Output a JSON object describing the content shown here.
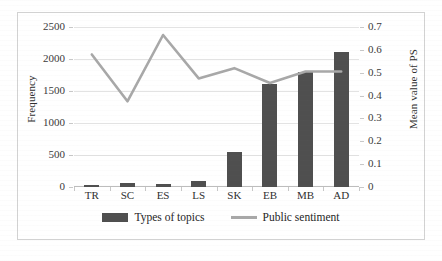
{
  "chart_data": {
    "type": "bar",
    "title": "",
    "categories": [
      "TR",
      "SC",
      "ES",
      "LS",
      "SK",
      "EB",
      "MB",
      "AD"
    ],
    "xlabel": "",
    "ylabel": "Frequency",
    "y2label": "Mean value of PS",
    "ylim": [
      0,
      2500
    ],
    "y2lim": [
      0,
      0.7
    ],
    "yticks": [
      "0",
      "500",
      "1000",
      "1500",
      "2000",
      "2500"
    ],
    "ytick_values": [
      0,
      500,
      1000,
      1500,
      2000,
      2500
    ],
    "y2ticks": [
      "0",
      "0.1",
      "0.2",
      "0.3",
      "0.4",
      "0.5",
      "0.6",
      "0.7"
    ],
    "y2tick_values": [
      0,
      0.1,
      0.2,
      0.3,
      0.4,
      0.5,
      0.6,
      0.7
    ],
    "grid": true,
    "legend_position": "bottom",
    "series": [
      {
        "name": "Types of topics",
        "type": "bar",
        "axis": "left",
        "color": "#4f4f4f",
        "values": [
          30,
          70,
          45,
          95,
          545,
          1610,
          1795,
          2110
        ]
      },
      {
        "name": "Public sentiment",
        "type": "line",
        "axis": "right",
        "color": "#a8a8a8",
        "values": [
          0.58,
          0.375,
          0.665,
          0.475,
          0.52,
          0.455,
          0.505,
          0.505
        ]
      }
    ]
  },
  "legend": {
    "items": [
      {
        "label": "Types of topics",
        "marker": "bar-swatch"
      },
      {
        "label": "Public sentiment",
        "marker": "line-swatch"
      }
    ]
  }
}
